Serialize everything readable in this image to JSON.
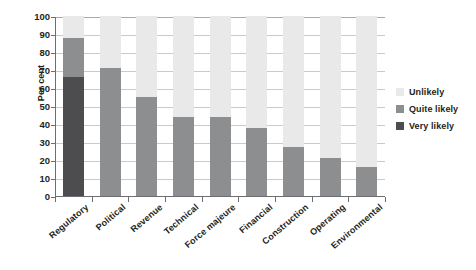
{
  "chart_data": {
    "type": "bar",
    "subtype": "stacked-bar-100",
    "title": "",
    "xlabel": "",
    "ylabel": "Per cent",
    "ylim": [
      0,
      100
    ],
    "ytick_step": 10,
    "ytick_labels": [
      "100",
      "90",
      "80",
      "70",
      "60",
      "50",
      "40",
      "30",
      "20",
      "10",
      "0"
    ],
    "grid": true,
    "grid_axis": "y",
    "legend_position": "right",
    "categories": [
      "Regulatory",
      "Political",
      "Revenue",
      "Technical",
      "Force majeure",
      "Financial",
      "Construction",
      "Operating",
      "Environmental"
    ],
    "series": [
      {
        "name": "Very likely",
        "color": "#4d4d4f",
        "values": [
          66,
          0,
          0,
          0,
          0,
          0,
          0,
          0,
          0
        ]
      },
      {
        "name": "Quite likely",
        "color": "#8d8e90",
        "values": [
          22,
          71,
          55,
          44,
          44,
          38,
          27,
          21,
          16
        ]
      },
      {
        "name": "Unlikely",
        "color": "#e9e9e9",
        "values": [
          12,
          29,
          45,
          56,
          56,
          62,
          73,
          79,
          84
        ]
      }
    ],
    "cumulative_tops": {
      "very_likely": [
        66,
        0,
        0,
        0,
        0,
        0,
        0,
        0,
        0
      ],
      "quite_likely_top": [
        88,
        71,
        55,
        44,
        44,
        38,
        27,
        21,
        16
      ],
      "total": [
        100,
        100,
        100,
        100,
        100,
        100,
        100,
        100,
        100
      ]
    }
  },
  "legend": {
    "items": [
      {
        "label": "Unlikely",
        "color": "#e9e9e9"
      },
      {
        "label": "Quite likely",
        "color": "#8d8e90"
      },
      {
        "label": "Very likely",
        "color": "#4d4d4f"
      }
    ]
  },
  "axis": {
    "y_title": "Per cent"
  },
  "colors": {
    "unlikely": "#e9e9e9",
    "quite_likely": "#8d8e90",
    "very_likely": "#4d4d4f",
    "axis": "#6d6e71",
    "grid": "#c9cacb",
    "text": "#231f20",
    "background": "#ffffff"
  }
}
